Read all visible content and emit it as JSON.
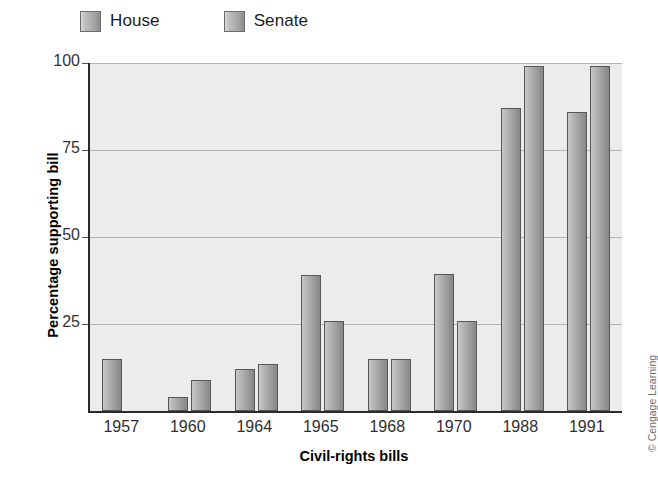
{
  "legend": {
    "position": "top-left",
    "entries": [
      {
        "label": "House",
        "name": "house"
      },
      {
        "label": "Senate",
        "name": "senate"
      }
    ]
  },
  "axes": {
    "ylabel": "Percentage supporting bill",
    "xlabel": "Civil-rights bills",
    "yticks": [
      "25",
      "50",
      "75",
      "100"
    ]
  },
  "credit": {
    "text": "© Cengage Learning"
  },
  "chart_data": {
    "type": "bar",
    "title": "",
    "subtitle": "",
    "xlabel": "Civil-rights bills",
    "ylabel": "Percentage supporting bill",
    "categories": [
      "1957",
      "1960",
      "1964",
      "1965",
      "1968",
      "1970",
      "1988",
      "1991"
    ],
    "series": [
      {
        "name": "House",
        "values": [
          15,
          4,
          12,
          39,
          15,
          39.5,
          87,
          86
        ]
      },
      {
        "name": "Senate",
        "values": [
          null,
          9,
          13.5,
          26,
          15,
          26,
          99,
          99
        ]
      }
    ],
    "ylim": [
      0,
      100
    ],
    "ytick_values": [
      0,
      25,
      50,
      75,
      100
    ],
    "grid": true,
    "grid_axis": "y",
    "legend_position": "top-left",
    "bar_color": "#a5a5a5",
    "plot_background": "#ececec"
  }
}
